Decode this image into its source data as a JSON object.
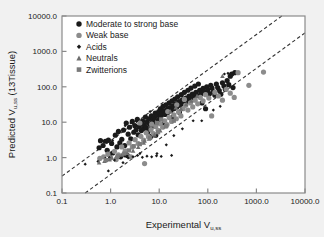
{
  "figure": {
    "background_color": "#f1f1f1",
    "plot_background_color": "#ffffff",
    "frame_color": "#8a8a8a"
  },
  "chart_data": {
    "type": "scatter",
    "title": "",
    "xlabel": "Experimental Vu,ss",
    "xlabel_main": "Experimental V",
    "xlabel_sub": "u,ss",
    "ylabel": "Predicted Vu,ss  (13Tissue)",
    "ylabel_main": "Predicted V",
    "ylabel_sub": "u,ss",
    "ylabel_tail": "  (13Tissue)",
    "xscale": "log",
    "yscale": "log",
    "xlim": [
      0.1,
      10000.0
    ],
    "ylim": [
      0.1,
      10000.0
    ],
    "grid": false,
    "xticks": [
      0.1,
      1.0,
      10.0,
      100.0,
      1000.0,
      10000.0
    ],
    "xtick_labels": [
      "0.1",
      "1.0",
      "10.0",
      "100.0",
      "1000.0",
      "10000.0"
    ],
    "yticks": [
      0.1,
      1.0,
      10.0,
      100.0,
      1000.0,
      10000.0
    ],
    "ytick_labels": [
      "0.1",
      "1.0",
      "10.0",
      "100.0",
      "1000.0",
      "10000.0"
    ],
    "legend_position": "top-left",
    "reference_lines": [
      {
        "name": "upper-3fold-line",
        "style": "dashed",
        "color": "#333333",
        "slope": 1,
        "factor": 3.0
      },
      {
        "name": "lower-3fold-line",
        "style": "dashed",
        "color": "#333333",
        "slope": 1,
        "factor": 0.3333
      }
    ],
    "series": [
      {
        "name": "Moderate to strong base",
        "marker": "circle",
        "color": "#1a1a1a",
        "size": 5.2,
        "points": [
          [
            0.62,
            3.0
          ],
          [
            0.7,
            2.2
          ],
          [
            0.78,
            2.9
          ],
          [
            0.85,
            1.6
          ],
          [
            0.9,
            3.1
          ],
          [
            0.95,
            1.2
          ],
          [
            1.05,
            2.5
          ],
          [
            1.1,
            1.35
          ],
          [
            1.25,
            4.3
          ],
          [
            1.35,
            2.0
          ],
          [
            1.45,
            5.5
          ],
          [
            1.55,
            2.6
          ],
          [
            1.7,
            3.3
          ],
          [
            1.85,
            6.0
          ],
          [
            1.95,
            2.2
          ],
          [
            2.1,
            9.5
          ],
          [
            2.3,
            4.6
          ],
          [
            2.45,
            7.2
          ],
          [
            2.6,
            3.4
          ],
          [
            2.8,
            10.5
          ],
          [
            3.0,
            5.2
          ],
          [
            3.15,
            8.0
          ],
          [
            3.35,
            6.1
          ],
          [
            3.55,
            12.0
          ],
          [
            3.7,
            4.4
          ],
          [
            3.9,
            7.5
          ],
          [
            4.1,
            9.0
          ],
          [
            4.3,
            5.8
          ],
          [
            4.55,
            11.0
          ],
          [
            4.75,
            6.6
          ],
          [
            4.95,
            8.4
          ],
          [
            5.2,
            14.0
          ],
          [
            5.4,
            7.0
          ],
          [
            5.6,
            10.0
          ],
          [
            5.85,
            5.4
          ],
          [
            6.1,
            12.5
          ],
          [
            6.35,
            8.8
          ],
          [
            6.6,
            6.3
          ],
          [
            6.9,
            15.0
          ],
          [
            7.1,
            9.6
          ],
          [
            7.4,
            11.5
          ],
          [
            7.7,
            7.8
          ],
          [
            8.0,
            13.5
          ],
          [
            8.3,
            18.0
          ],
          [
            8.6,
            9.2
          ],
          [
            9.0,
            16.0
          ],
          [
            9.4,
            11.0
          ],
          [
            9.8,
            20.0
          ],
          [
            10.2,
            13.0
          ],
          [
            10.6,
            24.0
          ],
          [
            11.0,
            15.5
          ],
          [
            11.5,
            18.5
          ],
          [
            12.0,
            28.0
          ],
          [
            12.6,
            21.0
          ],
          [
            13.2,
            16.5
          ],
          [
            13.8,
            31.0
          ],
          [
            14.5,
            23.0
          ],
          [
            15.2,
            19.0
          ],
          [
            16.0,
            35.0
          ],
          [
            16.8,
            26.0
          ],
          [
            17.5,
            21.5
          ],
          [
            18.4,
            40.0
          ],
          [
            19.2,
            29.0
          ],
          [
            20.0,
            24.0
          ],
          [
            21.0,
            45.0
          ],
          [
            22.0,
            33.0
          ],
          [
            23.0,
            27.0
          ],
          [
            24.0,
            52.0
          ],
          [
            25.5,
            38.0
          ],
          [
            27.0,
            30.0
          ],
          [
            28.5,
            60.0
          ],
          [
            30.0,
            43.0
          ],
          [
            31.5,
            34.0
          ],
          [
            33.0,
            70.0
          ],
          [
            35.0,
            48.0
          ],
          [
            37.0,
            38.0
          ],
          [
            39.0,
            80.0
          ],
          [
            41.0,
            55.0
          ],
          [
            43.0,
            44.0
          ],
          [
            45.0,
            92.0
          ],
          [
            48.0,
            62.0
          ],
          [
            51.0,
            50.0
          ],
          [
            54.0,
            105.0
          ],
          [
            57.0,
            70.0
          ],
          [
            60.0,
            56.0
          ],
          [
            64.0,
            120.0
          ],
          [
            68.0,
            80.0
          ],
          [
            72.0,
            63.0
          ],
          [
            76.0,
            35.0
          ],
          [
            80.0,
            90.0
          ],
          [
            85.0,
            72.0
          ],
          [
            90.0,
            24.0
          ],
          [
            95.0,
            100.0
          ],
          [
            100.0,
            82.0
          ],
          [
            108.0,
            64.0
          ],
          [
            115.0,
            110.0
          ],
          [
            122.0,
            92.0
          ],
          [
            130.0,
            72.0
          ],
          [
            140.0,
            58.0
          ],
          [
            150.0,
            120.0
          ],
          [
            160.0,
            95.0
          ],
          [
            172.0,
            78.0
          ],
          [
            185.0,
            62.0
          ],
          [
            200.0,
            130.0
          ],
          [
            215.0,
            105.0
          ],
          [
            230.0,
            85.0
          ],
          [
            250.0,
            150.0
          ],
          [
            270.0,
            115.0
          ],
          [
            290.0,
            200.0
          ],
          [
            310.0,
            230.0
          ],
          [
            330.0,
            95.0
          ],
          [
            360.0,
            250.0
          ],
          [
            2.2,
            1.15
          ],
          [
            1.6,
            1.05
          ],
          [
            0.58,
            1.9
          ],
          [
            8.5,
            4.3
          ],
          [
            12.0,
            9.0
          ],
          [
            19.0,
            14.0
          ],
          [
            26.0,
            19.0
          ],
          [
            6.8,
            4.0
          ]
        ]
      },
      {
        "name": "Weak base",
        "marker": "circle",
        "color": "#8c8c8c",
        "size": 5.2,
        "points": [
          [
            0.6,
            0.95
          ],
          [
            0.72,
            1.05
          ],
          [
            0.88,
            1.25
          ],
          [
            1.0,
            0.98
          ],
          [
            1.2,
            1.5
          ],
          [
            1.45,
            1.2
          ],
          [
            1.7,
            2.0
          ],
          [
            2.0,
            1.55
          ],
          [
            2.4,
            2.6
          ],
          [
            2.8,
            2.0
          ],
          [
            3.2,
            3.2
          ],
          [
            3.7,
            2.5
          ],
          [
            4.2,
            4.0
          ],
          [
            4.8,
            3.1
          ],
          [
            5.4,
            5.0
          ],
          [
            6.0,
            3.9
          ],
          [
            6.8,
            6.2
          ],
          [
            7.6,
            4.8
          ],
          [
            8.5,
            7.5
          ],
          [
            9.5,
            5.9
          ],
          [
            10.5,
            9.0
          ],
          [
            11.8,
            7.2
          ],
          [
            13.0,
            11.0
          ],
          [
            14.5,
            8.6
          ],
          [
            16.0,
            13.5
          ],
          [
            18.0,
            10.5
          ],
          [
            20.0,
            16.0
          ],
          [
            22.5,
            12.5
          ],
          [
            25.0,
            19.5
          ],
          [
            28.0,
            15.0
          ],
          [
            31.0,
            24.0
          ],
          [
            35.0,
            30.0
          ],
          [
            39.0,
            22.0
          ],
          [
            44.0,
            35.0
          ],
          [
            49.0,
            27.0
          ],
          [
            55.0,
            42.0
          ],
          [
            62.0,
            33.0
          ],
          [
            70.0,
            50.0
          ],
          [
            80.0,
            40.0
          ],
          [
            90.0,
            60.0
          ],
          [
            105.0,
            48.0
          ],
          [
            120.0,
            15.0
          ],
          [
            140.0,
            70.0
          ],
          [
            165.0,
            55.0
          ],
          [
            200.0,
            42.0
          ],
          [
            240.0,
            85.0
          ],
          [
            290.0,
            66.0
          ],
          [
            350.0,
            50.0
          ],
          [
            420.0,
            250.0
          ],
          [
            700.0,
            110.0
          ],
          [
            1400.0,
            260.0
          ],
          [
            5.0,
            0.68
          ],
          [
            4.0,
            9.5
          ],
          [
            2.6,
            1.05
          ],
          [
            1.3,
            0.88
          ],
          [
            7.0,
            8.8
          ],
          [
            15.0,
            20.0
          ],
          [
            23.0,
            31.0
          ],
          [
            33.0,
            44.0
          ]
        ]
      },
      {
        "name": "Acids",
        "marker": "diamond",
        "color": "#1a1a1a",
        "size": 3.2,
        "points": [
          [
            0.3,
            0.65
          ],
          [
            0.55,
            0.78
          ],
          [
            0.78,
            0.95
          ],
          [
            0.95,
            1.0
          ],
          [
            1.2,
            0.85
          ],
          [
            1.5,
            1.05
          ],
          [
            1.9,
            1.1
          ],
          [
            2.3,
            0.98
          ],
          [
            2.9,
            1.05
          ],
          [
            3.6,
            1.15
          ],
          [
            4.5,
            1.02
          ],
          [
            5.6,
            1.1
          ],
          [
            7.0,
            1.05
          ],
          [
            8.8,
            1.12
          ],
          [
            11.0,
            1.08
          ],
          [
            14.0,
            2.3
          ],
          [
            18.0,
            1.15
          ],
          [
            0.62,
            2.8
          ],
          [
            1.1,
            3.0
          ],
          [
            2.0,
            8.0
          ],
          [
            2.6,
            9.5
          ],
          [
            3.4,
            10.5
          ],
          [
            6.5,
            20.0
          ],
          [
            20.0,
            4.2
          ],
          [
            30.0,
            6.5
          ],
          [
            50.0,
            11.0
          ],
          [
            75.0,
            11.0
          ],
          [
            130.0,
            22.0
          ],
          [
            180.0,
            28.0
          ],
          [
            220.0,
            230.0
          ],
          [
            260.0,
            240.0
          ],
          [
            1.8,
            0.72
          ],
          [
            0.9,
            0.42
          ],
          [
            4.0,
            1.3
          ],
          [
            9.0,
            1.3
          ]
        ]
      },
      {
        "name": "Neutrals",
        "marker": "triangle",
        "color": "#6e6e6e",
        "size": 4.6,
        "points": [
          [
            0.58,
            0.72
          ],
          [
            0.75,
            0.8
          ],
          [
            0.95,
            0.88
          ],
          [
            1.3,
            1.05
          ],
          [
            1.7,
            1.2
          ],
          [
            2.2,
            1.35
          ],
          [
            2.9,
            1.55
          ],
          [
            3.7,
            2.0
          ],
          [
            4.8,
            2.6
          ],
          [
            6.2,
            3.4
          ],
          [
            8.0,
            4.4
          ],
          [
            10.5,
            5.8
          ],
          [
            13.5,
            7.5
          ],
          [
            17.0,
            20.0
          ],
          [
            22.0,
            26.0
          ],
          [
            28.0,
            24.0
          ],
          [
            36.0,
            32.0
          ],
          [
            46.0,
            40.0
          ],
          [
            60.0,
            55.0
          ],
          [
            200.0,
            200.0
          ],
          [
            1.05,
            1.0
          ],
          [
            5.0,
            3.0
          ]
        ]
      },
      {
        "name": "Zwitterions",
        "marker": "square",
        "color": "#7a7a7a",
        "size": 4.2,
        "points": [
          [
            0.8,
            0.85
          ],
          [
            1.4,
            1.1
          ],
          [
            2.4,
            1.6
          ],
          [
            4.0,
            2.4
          ],
          [
            6.5,
            3.6
          ],
          [
            9.5,
            5.2
          ],
          [
            14.0,
            7.8
          ],
          [
            20.0,
            11.0
          ],
          [
            9.0,
            9.5
          ],
          [
            11.0,
            12.0
          ],
          [
            3.0,
            2.1
          ],
          [
            1.9,
            1.3
          ]
        ]
      }
    ]
  },
  "legend": {
    "items": [
      {
        "label": "Moderate to strong base",
        "marker": "circle",
        "color": "#1a1a1a"
      },
      {
        "label": "Weak base",
        "marker": "circle",
        "color": "#8c8c8c"
      },
      {
        "label": "Acids",
        "marker": "diamond",
        "color": "#1a1a1a"
      },
      {
        "label": "Neutrals",
        "marker": "triangle",
        "color": "#6e6e6e"
      },
      {
        "label": "Zwitterions",
        "marker": "square",
        "color": "#7a7a7a"
      }
    ]
  }
}
